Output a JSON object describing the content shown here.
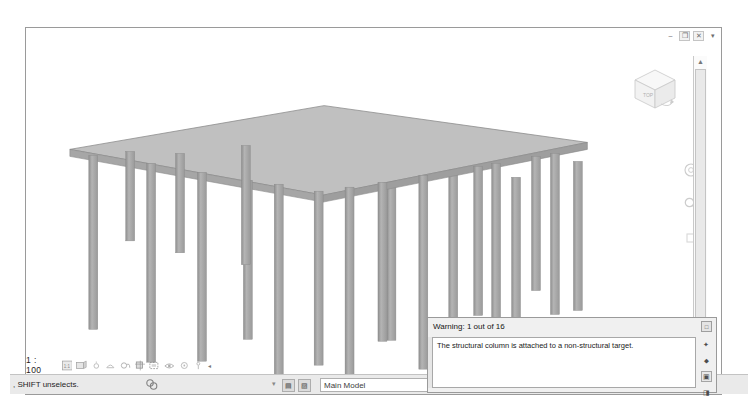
{
  "window": {
    "controls": [
      {
        "name": "minimize",
        "glyph": "–"
      },
      {
        "name": "restore",
        "glyph": "❐"
      },
      {
        "name": "close",
        "glyph": "✕"
      },
      {
        "name": "more",
        "glyph": "▾"
      }
    ]
  },
  "viewport": {
    "name": "3d-structural-model",
    "background": "#ffffff",
    "model": {
      "slab_color": "#b9b9b9",
      "slab_edge_color": "#8c8c8c",
      "column_color": "#a8a8a8",
      "column_shade_color": "#8e8e8e",
      "column_count": 16,
      "description": "Isometric concrete slab supported by rectangular structural columns"
    },
    "viewcube": {
      "label": "TOP",
      "name": "view-cube"
    },
    "navigation": [
      {
        "name": "steering-wheel-icon"
      },
      {
        "name": "zoom-magnifier-icon"
      },
      {
        "name": "pan-hand-icon"
      }
    ],
    "scrollbar": {
      "up_glyph": "▲",
      "down_glyph": "▼"
    }
  },
  "view_control_bar": {
    "scale": "1 : 100",
    "icons": [
      {
        "name": "detail-level-icon"
      },
      {
        "name": "visual-style-icon"
      },
      {
        "name": "sun-path-icon"
      },
      {
        "name": "shadows-icon"
      },
      {
        "name": "rendering-dialog-icon"
      },
      {
        "name": "crop-view-icon"
      },
      {
        "name": "show-crop-region-icon"
      },
      {
        "name": "temporary-hide-isolate-icon"
      },
      {
        "name": "reveal-hidden-elements-icon"
      },
      {
        "name": "worksharing-display-icon"
      }
    ],
    "overflow_glyph": "◂"
  },
  "status_bar": {
    "message": ", SHIFT unselects.",
    "filter_icon": "filter-selection-icon",
    "separator": "▾",
    "buttons": [
      {
        "name": "editable-only-toggle",
        "glyph": "▤"
      },
      {
        "name": "exclude-options-toggle",
        "glyph": "▨"
      }
    ],
    "model_select": {
      "value": "Main Model",
      "chevron": "▾"
    }
  },
  "warning_panel": {
    "title": "Warning: 1 out of 16",
    "message": "The structural column is attached to a non-structural target.",
    "expand_glyph": "□",
    "side_buttons": [
      {
        "name": "show-button",
        "glyph": "✦"
      },
      {
        "name": "more-info-button",
        "glyph": "⬥"
      },
      {
        "name": "delete-checked-button",
        "glyph": "▣"
      },
      {
        "name": "expand-collapse-button",
        "glyph": "◨"
      }
    ]
  }
}
